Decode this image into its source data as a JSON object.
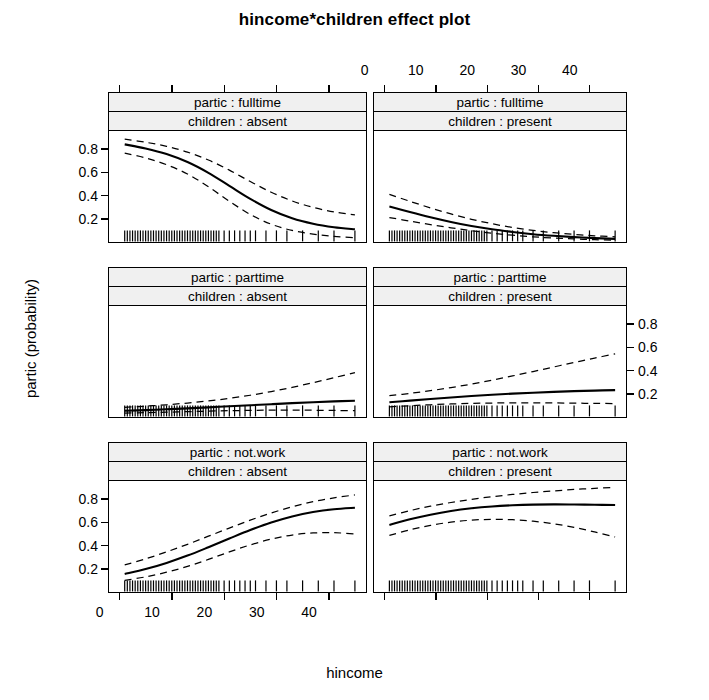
{
  "chart_data": {
    "type": "line",
    "title": "hincome*children effect plot",
    "xlabel": "hincome",
    "ylabel": "partic (probability)",
    "xlim": [
      -2,
      47
    ],
    "ylim": [
      0.0,
      0.95
    ],
    "grid": false,
    "legend": "none",
    "x_ticks": [
      0,
      10,
      20,
      30,
      40
    ],
    "x_tick_labels": [
      "0",
      "10",
      "20",
      "30",
      "40"
    ],
    "y_ticks": [
      0.2,
      0.4,
      0.6,
      0.8
    ],
    "y_tick_labels": [
      "0.2",
      "0.4",
      "0.6",
      "0.8"
    ],
    "layout": "3 rows x 2 columns trellis",
    "row_factor": "partic",
    "col_factor": "children",
    "row_levels": [
      "fulltime",
      "parttime",
      "not.work"
    ],
    "col_levels": [
      "absent",
      "present"
    ],
    "panels": [
      {
        "id": "fulltime-absent",
        "row": 0,
        "col": 0,
        "strip_top": "partic : fulltime",
        "strip_bottom": "children : absent",
        "x": [
          1,
          5,
          9,
          13,
          17,
          21,
          25,
          29,
          33,
          37,
          41,
          45
        ],
        "fit": [
          0.835,
          0.8,
          0.752,
          0.683,
          0.59,
          0.478,
          0.366,
          0.27,
          0.199,
          0.152,
          0.122,
          0.104
        ],
        "upper": [
          0.88,
          0.853,
          0.818,
          0.768,
          0.7,
          0.613,
          0.515,
          0.423,
          0.348,
          0.293,
          0.254,
          0.228
        ],
        "lower": [
          0.76,
          0.718,
          0.66,
          0.58,
          0.47,
          0.345,
          0.232,
          0.148,
          0.094,
          0.062,
          0.043,
          0.032
        ],
        "rug": [
          1,
          1.5,
          2,
          2.5,
          3,
          3.5,
          4,
          4.5,
          5,
          5.5,
          6,
          6.5,
          7,
          7.5,
          8,
          8.5,
          9,
          9.5,
          10,
          10.5,
          11,
          11.5,
          12,
          12.5,
          13,
          13.5,
          14,
          14.5,
          15,
          15.5,
          16,
          16.5,
          17,
          17.5,
          18,
          18.5,
          19,
          20,
          21,
          22,
          23,
          24,
          25,
          26,
          28,
          30,
          32,
          35,
          38,
          41,
          45
        ]
      },
      {
        "id": "fulltime-present",
        "row": 0,
        "col": 1,
        "strip_top": "partic : fulltime",
        "strip_bottom": "children : present",
        "x": [
          1,
          5,
          9,
          13,
          17,
          21,
          25,
          29,
          33,
          37,
          41,
          45
        ],
        "fit": [
          0.3,
          0.252,
          0.207,
          0.167,
          0.133,
          0.104,
          0.081,
          0.062,
          0.048,
          0.037,
          0.028,
          0.022
        ],
        "upper": [
          0.405,
          0.345,
          0.288,
          0.236,
          0.19,
          0.152,
          0.12,
          0.095,
          0.075,
          0.06,
          0.048,
          0.039
        ],
        "lower": [
          0.205,
          0.175,
          0.145,
          0.117,
          0.092,
          0.07,
          0.053,
          0.039,
          0.029,
          0.021,
          0.015,
          0.011
        ],
        "rug": [
          1,
          1.5,
          2,
          2.5,
          3,
          3.5,
          4,
          4.5,
          5,
          5.5,
          6,
          6.5,
          7,
          7.5,
          8,
          8.5,
          9,
          9.5,
          10,
          10.5,
          11,
          11.5,
          12,
          12.5,
          13,
          13.5,
          14,
          14.5,
          15,
          15.5,
          16,
          16.5,
          17,
          17.5,
          18,
          18.5,
          19,
          19.5,
          20,
          21,
          22,
          23,
          24,
          25,
          26,
          27,
          29,
          31,
          34,
          37,
          40,
          45
        ]
      },
      {
        "id": "parttime-absent",
        "row": 1,
        "col": 0,
        "strip_top": "partic : parttime",
        "strip_bottom": "children : absent",
        "x": [
          1,
          5,
          9,
          13,
          17,
          21,
          25,
          29,
          33,
          37,
          41,
          45
        ],
        "fit": [
          0.048,
          0.054,
          0.061,
          0.069,
          0.078,
          0.087,
          0.096,
          0.105,
          0.114,
          0.122,
          0.129,
          0.135
        ],
        "upper": [
          0.078,
          0.088,
          0.1,
          0.115,
          0.133,
          0.155,
          0.182,
          0.214,
          0.25,
          0.29,
          0.333,
          0.377
        ],
        "lower": [
          0.028,
          0.032,
          0.036,
          0.041,
          0.045,
          0.049,
          0.052,
          0.054,
          0.054,
          0.053,
          0.051,
          0.049
        ],
        "rug": [
          1,
          1.5,
          2,
          2.5,
          3,
          3.5,
          4,
          4.5,
          5,
          5.5,
          6,
          6.5,
          7,
          7.5,
          8,
          8.5,
          9,
          9.5,
          10,
          10.5,
          11,
          11.5,
          12,
          12.5,
          13,
          13.5,
          14,
          14.5,
          15,
          15.5,
          16,
          16.5,
          17,
          17.5,
          18,
          18.5,
          19,
          20,
          21,
          22,
          23,
          24,
          25,
          26,
          28,
          30,
          32,
          35,
          38,
          41,
          45
        ]
      },
      {
        "id": "parttime-present",
        "row": 1,
        "col": 1,
        "strip_top": "partic : parttime",
        "strip_bottom": "children : present",
        "x": [
          1,
          5,
          9,
          13,
          17,
          21,
          25,
          29,
          33,
          37,
          41,
          45
        ],
        "fit": [
          0.122,
          0.136,
          0.15,
          0.163,
          0.175,
          0.186,
          0.196,
          0.204,
          0.211,
          0.217,
          0.222,
          0.226
        ],
        "upper": [
          0.178,
          0.198,
          0.221,
          0.248,
          0.278,
          0.312,
          0.348,
          0.386,
          0.425,
          0.464,
          0.502,
          0.538
        ],
        "lower": [
          0.082,
          0.092,
          0.1,
          0.107,
          0.112,
          0.115,
          0.117,
          0.117,
          0.116,
          0.114,
          0.112,
          0.11
        ],
        "rug": [
          1,
          1.5,
          2,
          2.5,
          3,
          3.5,
          4,
          4.5,
          5,
          5.5,
          6,
          6.5,
          7,
          7.5,
          8,
          8.5,
          9,
          9.5,
          10,
          10.5,
          11,
          11.5,
          12,
          12.5,
          13,
          13.5,
          14,
          14.5,
          15,
          15.5,
          16,
          16.5,
          17,
          17.5,
          18,
          18.5,
          19,
          19.5,
          20,
          21,
          22,
          23,
          24,
          25,
          26,
          27,
          29,
          31,
          34,
          37,
          40,
          45
        ]
      },
      {
        "id": "notwork-absent",
        "row": 2,
        "col": 0,
        "strip_top": "partic : not.work",
        "strip_bottom": "children : absent",
        "x": [
          1,
          5,
          9,
          13,
          17,
          21,
          25,
          29,
          33,
          37,
          41,
          45
        ],
        "fit": [
          0.15,
          0.192,
          0.245,
          0.308,
          0.38,
          0.455,
          0.528,
          0.593,
          0.645,
          0.683,
          0.707,
          0.72
        ],
        "upper": [
          0.228,
          0.28,
          0.34,
          0.405,
          0.475,
          0.545,
          0.613,
          0.675,
          0.728,
          0.772,
          0.805,
          0.83
        ],
        "lower": [
          0.095,
          0.125,
          0.165,
          0.215,
          0.275,
          0.34,
          0.4,
          0.45,
          0.485,
          0.503,
          0.505,
          0.495
        ],
        "rug": [
          1,
          1.5,
          2,
          2.5,
          3,
          3.5,
          4,
          4.5,
          5,
          5.5,
          6,
          6.5,
          7,
          7.5,
          8,
          8.5,
          9,
          9.5,
          10,
          10.5,
          11,
          11.5,
          12,
          12.5,
          13,
          13.5,
          14,
          14.5,
          15,
          15.5,
          16,
          16.5,
          17,
          17.5,
          18,
          18.5,
          19,
          20,
          21,
          22,
          23,
          24,
          25,
          26,
          28,
          30,
          32,
          35,
          38,
          41,
          45
        ]
      },
      {
        "id": "notwork-present",
        "row": 2,
        "col": 1,
        "strip_top": "partic : not.work",
        "strip_bottom": "children : present",
        "x": [
          1,
          5,
          9,
          13,
          17,
          21,
          25,
          29,
          33,
          37,
          41,
          45
        ],
        "fit": [
          0.572,
          0.62,
          0.66,
          0.692,
          0.715,
          0.731,
          0.741,
          0.747,
          0.749,
          0.748,
          0.746,
          0.743
        ],
        "upper": [
          0.65,
          0.695,
          0.733,
          0.765,
          0.792,
          0.815,
          0.834,
          0.851,
          0.865,
          0.877,
          0.887,
          0.896
        ],
        "lower": [
          0.482,
          0.53,
          0.568,
          0.596,
          0.613,
          0.62,
          0.617,
          0.604,
          0.582,
          0.551,
          0.512,
          0.468
        ],
        "rug": [
          1,
          1.5,
          2,
          2.5,
          3,
          3.5,
          4,
          4.5,
          5,
          5.5,
          6,
          6.5,
          7,
          7.5,
          8,
          8.5,
          9,
          9.5,
          10,
          10.5,
          11,
          11.5,
          12,
          12.5,
          13,
          13.5,
          14,
          14.5,
          15,
          15.5,
          16,
          16.5,
          17,
          17.5,
          18,
          18.5,
          19,
          19.5,
          20,
          21,
          22,
          23,
          24,
          25,
          26,
          27,
          29,
          31,
          34,
          37,
          40,
          45
        ]
      }
    ]
  },
  "axes": {
    "top_tick_labels": [
      "0",
      "10",
      "20",
      "30",
      "40"
    ],
    "bottom_tick_labels": [
      "0",
      "10",
      "20",
      "30",
      "40"
    ],
    "left_tick_labels": [
      "0.8",
      "0.6",
      "0.4",
      "0.2"
    ],
    "right_tick_labels": [
      "0.8",
      "0.6",
      "0.4",
      "0.2"
    ]
  }
}
